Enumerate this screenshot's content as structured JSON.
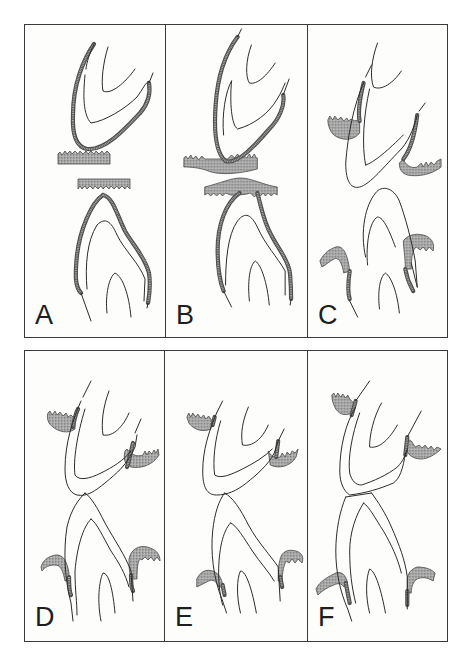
{
  "figure": {
    "colors": {
      "outline": "#2b2b2b",
      "gum_fill": "#a9a9a9",
      "border": "#3a3a3a",
      "background": "#fdfdfc"
    },
    "rows": [
      {
        "panels": [
          {
            "label": "A",
            "width": 140,
            "gums": [
              "M33,129 L35,127 L37,130 L40,126 L42,129 L45,126 L47,129 L50,126 L53,129 L55,126 L58,129 L61,126 L63,129 L66,126 L69,129 L71,126 L74,129 L77,126 L79,129 L82,126 L85,129 L85,139 L33,139 Z",
              "M53,154 L105,154 L105,164 L102,161 L100,164 L97,161 L94,164 L92,161 L89,164 L86,161 L84,164 L81,161 L78,164 L76,161 L73,164 L70,161 L68,164 L65,161 L62,164 L60,161 L57,164 L55,161 L53,164 Z"
            ],
            "thick": [
              "M69,19 C58,35 48,60 48,90 C47,112 52,122 62,124 C80,126 100,104 115,88 C122,80 126,70 124,58",
              "M78,170 C66,178 55,205 52,230 C50,250 50,262 56,268 M78,170 C88,172 92,190 100,206 C108,220 120,232 124,248 C126,262 124,272 123,278"
            ],
            "thin": [
              "M69,19 C64,30 62,36 61,44 M124,58 L128,48",
              "M60,50 C58,70 58,90 66,98 C80,96 100,84 112,72 C118,64 120,58 124,56",
              "M83,22 C78,38 76,56 78,66 C86,70 100,58 110,44",
              "M56,268 L66,296 M123,278 L122,283",
              "M62,264 C60,240 62,216 72,200 C80,192 86,196 92,210 C100,226 114,238 120,254 L119,276",
              "M82,288 C80,270 84,252 90,248 C98,252 104,270 106,292"
            ]
          },
          {
            "label": "B",
            "width": 142,
            "gums": [
              "M18,133 L20,131 L22,134 L25,130 L27,134 L30,131 L33,135 L36,131 L39,134 L58,134 L62,134 L66,130 L69,133 L72,129 L75,133 L78,130 L81,133 L84,129 L86,133 L89,129 L91,133 L92,133 L92,144 C70,150 50,150 40,145 C30,142 22,142 18,142 Z",
              "M39,162 C55,158 66,153 75,153 C86,153 98,160 112,162 L112,170 L109,168 L106,171 L103,168 L100,171 L98,168 L95,171 L92,169 L89,172 L85,168 C80,170 72,170 65,170 L60,168 L57,171 L54,168 L51,171 L48,168 L45,171 L42,168 L39,170 Z"
            ],
            "thick": [
              "M72,12 C60,28 52,50 50,80 C48,108 50,128 60,136 C72,140 90,120 104,104 C114,94 120,80 118,70",
              "M74,168 C60,178 52,200 52,225 C52,245 54,256 58,266 M92,168 C96,182 98,196 106,210 C112,222 124,236 125,250 C126,262 126,268 126,274"
            ],
            "thin": [
              "M72,12 L76,4 M118,70 L124,54",
              "M58,110 C56,90 60,66 66,56 M66,56 C64,78 66,100 72,104 C88,100 104,88 112,74 C116,68 118,62 120,58",
              "M86,20 C80,36 80,52 84,58 C92,60 102,50 110,38",
              "M58,266 L66,282 M126,274 L125,280",
              "M60,260 C60,236 62,210 72,196 C80,186 86,190 92,202 C100,220 112,232 120,246 L120,270",
              "M84,276 C82,258 84,240 90,236 C96,240 102,258 104,280"
            ]
          },
          {
            "label": "C",
            "width": 142,
            "gums": [
              "M20,95 L22,91 L25,95 L27,91 L30,95 L33,92 L36,96 L39,93 L41,96 L43,94 C46,96 50,96 52,94 L52,108 C46,116 34,116 26,110 C22,106 20,100 20,95 Z",
              "M96,134 C98,140 104,144 110,142 L114,138 L116,142 L119,137 L121,141 L124,137 L127,140 L130,136 L134,134 L134,142 C124,150 110,152 100,150 C94,148 92,144 92,138 Z",
              "M12,236 C16,228 22,224 28,222 C36,220 40,230 42,246 L36,248 C34,236 30,232 26,234 C22,236 18,240 14,242 Z",
              "M96,216 C100,210 108,208 116,210 C124,212 128,218 126,226 L122,222 L119,226 L116,222 L113,225 L109,222 C106,224 104,230 104,244 L98,244 C98,232 96,222 96,216 Z"
            ],
            "thick": [
              "M56,58 C52,74 50,86 52,96",
              "M110,90 C108,106 104,124 96,134",
              "M42,246 C40,260 40,268 42,274",
              "M98,244 C100,256 104,262 106,266"
            ],
            "thin": [
              "M58,52 L64,40 M112,86 L118,78",
              "M56,58 C46,80 40,110 38,138 C38,158 44,164 52,162 C62,160 78,140 92,126 C100,118 106,106 110,90",
              "M62,64 C56,90 54,120 58,140 M58,140 C66,138 82,124 96,110",
              "M70,18 C64,34 62,52 66,62 C74,66 86,58 94,46",
              "M58,232 C52,206 58,180 68,168 C74,160 86,162 92,176 C98,192 104,214 108,236 L110,262",
              "M42,276 L50,292 M104,238 L110,262",
              "M72,284 C70,268 72,252 78,248 C84,252 90,268 92,288",
              "M60,240 C58,220 62,196 70,192 C76,192 82,206 88,222"
            ]
          }
        ]
      },
      {
        "panels": [
          {
            "label": "D",
            "width": 139,
            "gums": [
              "M23,62 L25,60 L27,64 L30,60 L32,64 L35,61 L38,65 L41,62 L43,66 L46,64 L50,68 L50,78 C42,84 30,80 24,72 C22,68 22,64 23,62 Z",
              "M102,98 C106,104 112,106 118,104 L120,100 L122,104 L124,100 L127,103 L129,99 L131,102 L133,98 L134,104 C128,114 116,118 106,116 C100,114 98,108 100,100 Z",
              "M16,216 C18,208 26,204 32,204 C38,204 42,210 44,222 L44,230 L40,230 C38,220 36,214 30,214 C24,214 20,216 17,220 Z",
              "M104,208 C106,198 114,194 122,196 C130,198 135,202 135,210 L132,206 L129,210 L126,206 L123,209 L120,206 L117,209 C114,206 112,212 112,228 L106,228 C104,220 104,214 104,208 Z"
            ],
            "thick": [
              "M53,58 C50,64 49,70 48,76",
              "M108,92 C106,100 104,110 102,116",
              "M44,226 C44,234 44,240 46,244",
              "M106,224 C106,232 106,236 108,240"
            ],
            "thin": [
              "M58,46 L66,30 M110,82 L116,68",
              "M56,50 C48,68 40,92 40,118 C40,132 44,142 52,144 C62,146 70,140 80,132 C92,122 102,114 110,96 L112,84",
              "M60,58 C52,84 48,110 50,124 C54,130 64,128 76,122 C88,116 98,110 106,100",
              "M84,40 C78,56 76,72 78,84 C88,86 98,76 104,62",
              "M60,142 C54,148 46,158 42,176 C38,200 40,230 46,252 L48,270",
              "M60,142 C66,146 72,156 80,172 C90,190 100,204 106,220 L108,250",
              "M66,168 C58,176 52,196 50,220 C50,240 52,250 52,264 M66,168 C72,172 78,186 86,200 C94,212 100,222 104,236",
              "M76,270 C72,250 74,230 78,222 C84,222 88,240 90,262"
            ]
          },
          {
            "label": "E",
            "width": 143,
            "gums": [
              "M22,66 L24,62 L26,66 L28,62 L31,66 L33,63 L36,67 L39,64 L41,68 L44,65 L46,68 L48,70 L46,78 C38,82 28,78 24,72 Z",
              "M104,100 C106,104 110,108 116,106 L118,102 L121,106 L123,101 L126,104 L128,100 L131,102 L134,98 L132,106 C126,116 114,118 106,114 Z",
              "M32,228 C36,220 42,218 48,220 C54,222 58,228 58,236 L54,236 C52,230 48,228 44,230 C40,232 36,234 32,236 Z",
              "M116,208 C118,200 124,198 132,200 C138,202 140,206 138,212 L134,208 L131,212 L128,208 L125,212 L122,210 C120,214 118,220 118,230 L114,230 C114,222 114,214 116,208 Z"
            ],
            "thick": [
              "M50,66 L48,74",
              "M114,90 L112,106",
              "M58,234 L60,244",
              "M116,226 L118,236"
            ],
            "thin": [
              "M52,62 L58,50 M114,90 L120,78",
              "M52,62 C44,80 38,100 38,120 C38,136 42,144 52,144 C62,144 72,140 82,132 C92,124 104,114 110,102 L114,90",
              "M56,70 C50,90 48,110 50,124 C56,128 66,124 78,118 C90,112 100,106 108,98",
              "M84,56 C78,70 76,82 78,94 C88,96 98,88 104,74",
              "M60,142 C54,150 50,162 48,180 C46,200 48,226 58,250 L62,262",
              "M60,142 C68,146 76,158 84,174 C94,192 106,204 114,216 L116,250",
              "M66,172 C58,180 54,200 54,222 C54,236 56,246 58,254 M66,172 C72,174 80,188 88,200 C96,212 104,220 110,230",
              "M76,262 C72,246 72,228 76,220 C82,220 88,240 92,262"
            ]
          },
          {
            "label": "F",
            "width": 142,
            "gums": [
              "M24,44 L26,42 L28,46 L30,42 L33,46 L35,43 L38,47 L40,44 L42,48 L46,52 L46,60 C40,66 32,64 28,58 C26,54 24,50 24,44 Z",
              "M98,96 C100,104 106,108 114,108 C120,108 128,104 134,98 L130,96 L127,99 L124,95 L121,98 L118,94 L115,97 L112,94 L108,96 L104,90 L100,88 Z",
              "M8,238 C12,230 20,226 28,222 C34,220 38,224 40,232 L36,236 C34,232 30,232 26,234 C20,236 14,240 10,244 Z",
              "M100,230 C100,222 104,218 110,216 C118,216 124,218 128,222 L126,230 C120,226 114,226 110,228 C106,230 104,236 104,242 L100,242 Z"
            ],
            "thick": [
              "M48,50 L44,64",
              "M100,86 L98,104",
              "M38,232 L42,252",
              "M100,240 L100,254"
            ],
            "thin": [
              "M48,50 L62,30 M100,86 L114,60",
              "M48,56 C38,72 32,96 32,120 C32,132 36,140 42,144 C58,142 72,138 86,132 C92,128 96,118 98,102",
              "M52,62 C44,84 40,108 42,122 C44,130 48,134 54,134 C66,130 80,124 90,116 C96,110 98,104 100,98",
              "M74,52 C66,66 62,84 62,96 C72,98 82,88 90,74",
              "M38,146 C32,160 28,180 28,200 C28,220 32,240 40,258 L44,270",
              "M64,142 C70,150 78,162 84,176 C92,194 98,210 100,226 L100,258",
              "M56,152 C48,164 42,182 42,200 C42,220 44,236 48,252 M56,152 C62,156 68,168 76,180 C84,194 90,206 94,222",
              "M62,262 C58,246 58,228 62,218 C68,220 74,240 78,262",
              "M38,146 L64,142"
            ]
          }
        ]
      }
    ]
  }
}
